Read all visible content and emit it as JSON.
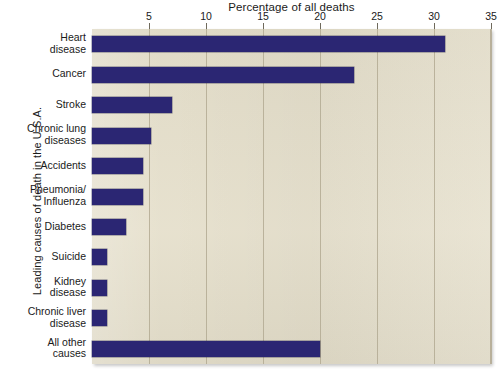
{
  "chart_data": {
    "type": "bar",
    "orientation": "horizontal",
    "title": "Percentage of all deaths",
    "xlabel": "Percentage of all deaths",
    "ylabel": "Leading causes of death in the U.S.A.",
    "xlim": [
      0,
      35
    ],
    "xticks": [
      5,
      10,
      15,
      20,
      25,
      30,
      35
    ],
    "xtick_labels": [
      "5",
      "10",
      "15",
      "20",
      "25",
      "30",
      "35"
    ],
    "grid": true,
    "legend": "none",
    "bar_color": "#2b2673",
    "plot_background": "#e5dfcb",
    "categories": [
      "Heart\ndisease",
      "Cancer",
      "Stroke",
      "Chronic lung\ndiseases",
      "Accidents",
      "Pneumonia/\nInfluenza",
      "Diabetes",
      "Suicide",
      "Kidney\ndisease",
      "Chronic liver\ndisease",
      "All other\ncauses"
    ],
    "values": [
      31,
      23,
      7,
      5.2,
      4.5,
      4.5,
      3,
      1.3,
      1.3,
      1.3,
      20
    ]
  }
}
